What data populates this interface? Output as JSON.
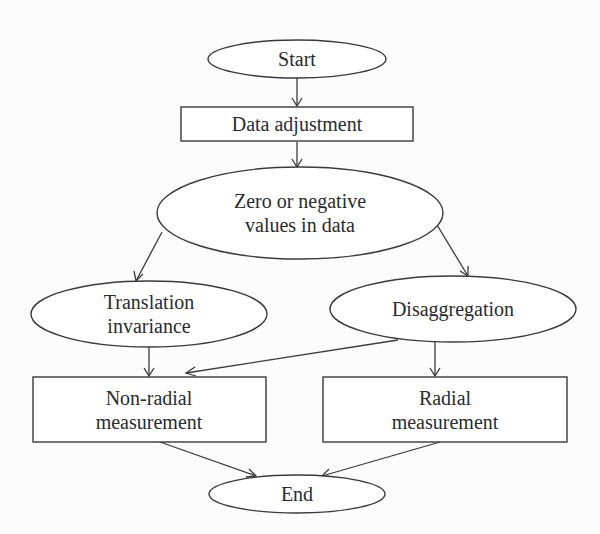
{
  "diagram": {
    "type": "flowchart",
    "colors": {
      "stroke": "#3a3a3a",
      "text": "#2b2b2b",
      "fill": "#ffffff",
      "background": "#fcfcfc"
    },
    "nodes": [
      {
        "id": "start",
        "shape": "ellipse",
        "lines": [
          "Start"
        ]
      },
      {
        "id": "data_adjustment",
        "shape": "rectangle",
        "lines": [
          "Data adjustment"
        ]
      },
      {
        "id": "zero_negative",
        "shape": "ellipse",
        "lines": [
          "Zero or negative",
          "values in data"
        ]
      },
      {
        "id": "translation_invariance",
        "shape": "ellipse",
        "lines": [
          "Translation",
          "invariance"
        ]
      },
      {
        "id": "disaggregation",
        "shape": "ellipse",
        "lines": [
          "Disaggregation"
        ]
      },
      {
        "id": "non_radial",
        "shape": "rectangle",
        "lines": [
          "Non-radial",
          "measurement"
        ]
      },
      {
        "id": "radial",
        "shape": "rectangle",
        "lines": [
          "Radial",
          "measurement"
        ]
      },
      {
        "id": "end",
        "shape": "ellipse",
        "lines": [
          "End"
        ]
      }
    ],
    "edges": [
      {
        "from": "start",
        "to": "data_adjustment"
      },
      {
        "from": "data_adjustment",
        "to": "zero_negative"
      },
      {
        "from": "zero_negative",
        "to": "translation_invariance"
      },
      {
        "from": "zero_negative",
        "to": "disaggregation"
      },
      {
        "from": "translation_invariance",
        "to": "non_radial"
      },
      {
        "from": "disaggregation",
        "to": "non_radial"
      },
      {
        "from": "disaggregation",
        "to": "radial"
      },
      {
        "from": "non_radial",
        "to": "end"
      },
      {
        "from": "radial",
        "to": "end"
      }
    ]
  }
}
